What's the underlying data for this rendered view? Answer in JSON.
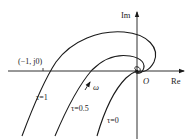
{
  "diagram": {
    "type": "nyquist-plot",
    "axes": {
      "x_label": "Re",
      "y_label": "Im",
      "origin_label": "O"
    },
    "point_label": "(−1, j0)",
    "direction_label": "ω",
    "curves": [
      {
        "label": "τ=1",
        "param": "tau",
        "value": 1
      },
      {
        "label": "τ=0.5",
        "param": "tau",
        "value": 0.5
      },
      {
        "label": "τ=0",
        "param": "tau",
        "value": 0
      }
    ],
    "colors": {
      "stroke": "#1a1a1a",
      "background": "#ffffff"
    }
  }
}
